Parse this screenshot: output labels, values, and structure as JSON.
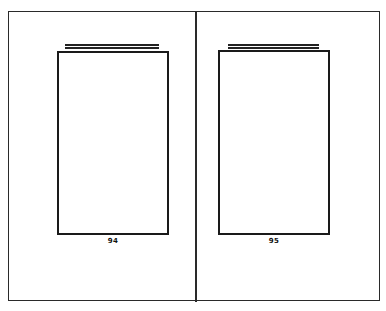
{
  "spread": {
    "left_page": {
      "page_number": "94"
    },
    "right_page": {
      "page_number": "95"
    }
  }
}
